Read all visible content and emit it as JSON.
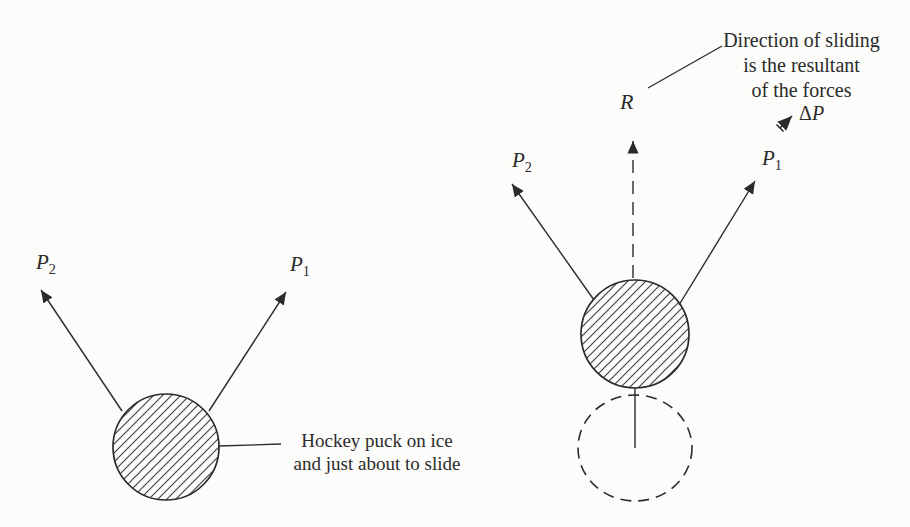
{
  "figure": {
    "background": "#fcfcfa",
    "ink": "#2b2b2b",
    "hatch_color": "#3a3a3a"
  },
  "left_diagram": {
    "p2_label": {
      "base": "P",
      "sub": "2"
    },
    "p1_label": {
      "base": "P",
      "sub": "1"
    },
    "caption_line1": "Hockey puck on ice",
    "caption_line2": "and just about to slide"
  },
  "right_diagram": {
    "p2_label": {
      "base": "P",
      "sub": "2"
    },
    "p1_label": {
      "base": "P",
      "sub": "1"
    },
    "r_label": "R",
    "delta_p_label": {
      "delta": "Δ",
      "base": "P"
    },
    "annotation_line1": "Direction of sliding",
    "annotation_line2": "is the resultant",
    "annotation_line3": "of the forces"
  }
}
